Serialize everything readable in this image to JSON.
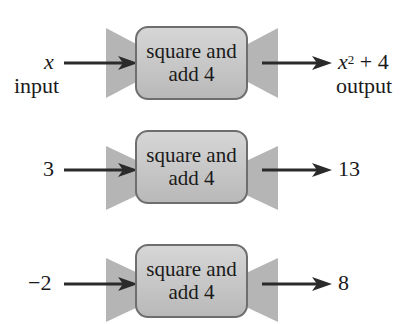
{
  "colors": {
    "box_fill": "#c8c8c8",
    "box_border": "#6e6e6e",
    "funnel": "#b5b5b5",
    "arrow": "#2a2a2a"
  },
  "machines": [
    {
      "input": "x",
      "input_caption": "input",
      "line1": "square and",
      "line2": "add 4",
      "output_base": "x",
      "output_exp": "2",
      "output_rest": " + 4",
      "output_caption": "output"
    },
    {
      "input": "3",
      "line1": "square and",
      "line2": "add 4",
      "output": "13"
    },
    {
      "input": "−2",
      "line1": "square and",
      "line2": "add 4",
      "output": "8"
    }
  ]
}
